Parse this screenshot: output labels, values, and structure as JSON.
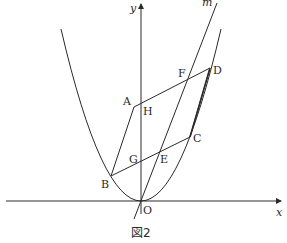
{
  "figure": {
    "caption": "図2",
    "axes": {
      "x_label": "x",
      "y_label": "y",
      "origin_label": "O"
    },
    "line_label": "m",
    "points": {
      "A": "A",
      "B": "B",
      "C": "C",
      "D": "D",
      "E": "E",
      "F": "F",
      "G": "G",
      "H": "H"
    },
    "colors": {
      "stroke": "#2a2a2a",
      "background": "#ffffff"
    }
  }
}
